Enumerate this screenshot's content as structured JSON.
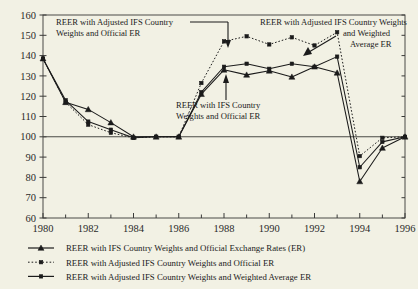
{
  "chart_data": {
    "type": "line",
    "title": "",
    "xlabel": "",
    "ylabel": "",
    "xlim": [
      1980,
      1996
    ],
    "ylim": [
      60,
      160
    ],
    "grid": false,
    "legend_position": "bottom",
    "x": [
      1980,
      1981,
      1982,
      1983,
      1984,
      1985,
      1986,
      1987,
      1988,
      1989,
      1990,
      1991,
      1992,
      1993,
      1994,
      1995,
      1996
    ],
    "y_ticks": [
      60,
      70,
      80,
      90,
      100,
      110,
      120,
      130,
      140,
      150,
      160
    ],
    "x_ticks": [
      1980,
      1982,
      1984,
      1986,
      1988,
      1990,
      1992,
      1994,
      1996
    ],
    "x_tick_labels": [
      "1980",
      "1982",
      "1984",
      "1986",
      "1988",
      "1990",
      "1992",
      "1994",
      "1996"
    ],
    "y_tick_labels": [
      "60",
      "70",
      "80",
      "90",
      "100",
      "110",
      "120",
      "130",
      "140",
      "150",
      "160"
    ],
    "reference_line_y": 100,
    "series": [
      {
        "name": "REER with IFS Country Weights and Official Exchange Rates (ER)",
        "marker": "triangle",
        "line_style": "solid",
        "values": [
          138.5,
          117.0,
          113.5,
          107.0,
          100.0,
          100.0,
          100.0,
          121.0,
          133.0,
          130.5,
          132.5,
          129.5,
          134.5,
          131.5,
          78.0,
          94.5,
          100.0
        ]
      },
      {
        "name": "REER with Adjusted IFS Country Weights and Official ER",
        "marker": "square",
        "line_style": "dotted",
        "values": [
          138.5,
          117.0,
          106.0,
          102.0,
          99.5,
          100.0,
          100.0,
          126.5,
          147.0,
          149.5,
          145.5,
          149.0,
          145.0,
          151.5,
          90.5,
          99.5,
          100.0
        ]
      },
      {
        "name": "REER with Adjusted IFS Country Weights and Weighted Average ER",
        "marker": "square",
        "line_style": "solid",
        "values": [
          138.5,
          118.0,
          107.5,
          103.5,
          99.5,
          100.0,
          100.0,
          122.0,
          134.5,
          136.0,
          133.5,
          136.0,
          134.5,
          139.5,
          85.0,
          97.5,
          100.0
        ]
      }
    ],
    "annotations": [
      {
        "id": "annot-upper-left",
        "lines": [
          "REER with Adjusted IFS Country",
          "Weights and Official ER"
        ]
      },
      {
        "id": "annot-upper-right",
        "lines": [
          "REER with Adjusted IFS Country Weights",
          "and Weighted",
          "Average ER"
        ]
      },
      {
        "id": "annot-lower-center",
        "lines": [
          "REER with IFS Country",
          "Weights and Official ER"
        ]
      }
    ],
    "legend": [
      {
        "label": "REER with IFS Country Weights and Official Exchange Rates (ER)",
        "marker": "triangle",
        "line_style": "solid"
      },
      {
        "label": "REER with Adjusted IFS Country Weights and Official ER",
        "marker": "square",
        "line_style": "dotted"
      },
      {
        "label": "REER with Adjusted IFS Country Weights and Weighted Average ER",
        "marker": "square",
        "line_style": "solid"
      }
    ],
    "colors": {
      "background": "#f2f1e4",
      "ink": "#1b1b1b",
      "axis": "#3a3a38"
    }
  }
}
